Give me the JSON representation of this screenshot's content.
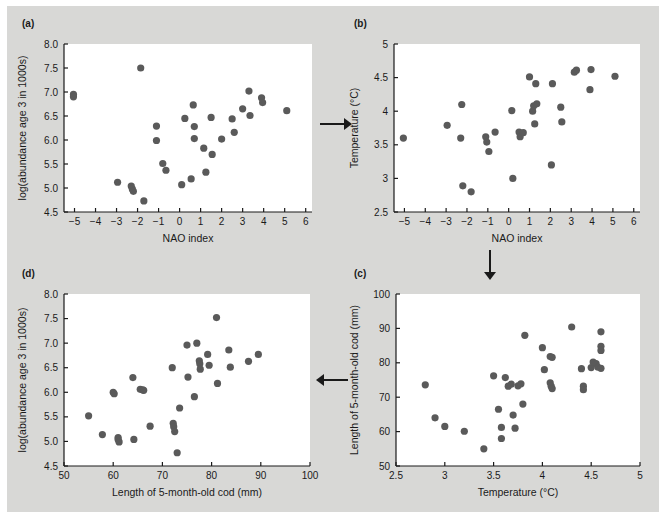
{
  "figure": {
    "background_color": "#d8d8d6",
    "plot_background_color": "#ffffff",
    "marker_color": "#5a5a5a",
    "axis_color": "#1a1a1a"
  },
  "panels": [
    {
      "id": "a",
      "label": "(a)",
      "chart_data": {
        "type": "scatter",
        "title": "",
        "xlabel": "NAO index",
        "ylabel": "log(abundance age 3 in 1000s)",
        "xlim": [
          -5.5,
          6.3
        ],
        "ylim": [
          4.5,
          8.0
        ],
        "xticks": [
          -5,
          -4,
          -3,
          -2,
          -1,
          0,
          1,
          2,
          3,
          4,
          5,
          6
        ],
        "xticklabels": [
          "−5",
          "−4",
          "−3",
          "−2",
          "−1",
          "0",
          "1",
          "2",
          "3",
          "4",
          "5",
          "6"
        ],
        "yticks": [
          4.5,
          5.0,
          5.5,
          6.0,
          6.5,
          7.0,
          7.5,
          8.0
        ],
        "yticklabels": [
          "4.5",
          "5.0",
          "5.5",
          "6.0",
          "6.5",
          "7.0",
          "7.5",
          "8.0"
        ],
        "grid": false,
        "legend": "none",
        "points": [
          [
            -5.05,
            6.95
          ],
          [
            -5.05,
            6.9
          ],
          [
            -2.95,
            5.12
          ],
          [
            -2.3,
            5.04
          ],
          [
            -2.25,
            4.98
          ],
          [
            -2.2,
            4.93
          ],
          [
            -1.85,
            7.5
          ],
          [
            -1.7,
            4.73
          ],
          [
            -1.1,
            6.29
          ],
          [
            -1.1,
            5.99
          ],
          [
            -0.8,
            5.51
          ],
          [
            -0.65,
            5.37
          ],
          [
            0.1,
            5.07
          ],
          [
            0.25,
            6.45
          ],
          [
            0.55,
            5.19
          ],
          [
            0.65,
            6.73
          ],
          [
            0.7,
            6.28
          ],
          [
            0.7,
            6.03
          ],
          [
            1.15,
            5.83
          ],
          [
            1.25,
            5.33
          ],
          [
            1.5,
            6.47
          ],
          [
            1.55,
            5.7
          ],
          [
            2.0,
            6.02
          ],
          [
            2.5,
            6.44
          ],
          [
            2.6,
            6.16
          ],
          [
            3.0,
            6.65
          ],
          [
            3.3,
            7.02
          ],
          [
            3.35,
            6.51
          ],
          [
            3.9,
            6.88
          ],
          [
            3.95,
            6.78
          ],
          [
            5.1,
            6.61
          ]
        ]
      }
    },
    {
      "id": "b",
      "label": "(b)",
      "chart_data": {
        "type": "scatter",
        "title": "",
        "xlabel": "NAO index",
        "ylabel": "Temperature (°C)",
        "xlim": [
          -5.5,
          6.3
        ],
        "ylim": [
          2.5,
          5.0
        ],
        "xticks": [
          -5,
          -4,
          -3,
          -2,
          -1,
          0,
          1,
          2,
          3,
          4,
          5,
          6
        ],
        "xticklabels": [
          "−5",
          "−4",
          "−3",
          "−2",
          "−1",
          "0",
          "1",
          "2",
          "3",
          "4",
          "5",
          "6"
        ],
        "yticks": [
          2.5,
          3,
          3.5,
          4,
          4.5,
          5
        ],
        "yticklabels": [
          "2.5",
          "3",
          "3.5",
          "4",
          "4.5",
          "5"
        ],
        "grid": false,
        "legend": "none",
        "points": [
          [
            -5.05,
            3.6
          ],
          [
            -2.95,
            3.79
          ],
          [
            -2.25,
            4.1
          ],
          [
            -2.3,
            3.6
          ],
          [
            -2.2,
            2.89
          ],
          [
            -1.8,
            2.8
          ],
          [
            -1.1,
            3.62
          ],
          [
            -1.05,
            3.54
          ],
          [
            -0.95,
            3.4
          ],
          [
            -0.65,
            3.69
          ],
          [
            0.15,
            4.01
          ],
          [
            0.2,
            3.0
          ],
          [
            0.5,
            3.69
          ],
          [
            0.55,
            3.62
          ],
          [
            0.7,
            3.68
          ],
          [
            1.0,
            4.51
          ],
          [
            1.15,
            4.0
          ],
          [
            1.2,
            4.08
          ],
          [
            1.3,
            4.41
          ],
          [
            1.35,
            4.11
          ],
          [
            1.25,
            3.81
          ],
          [
            2.05,
            3.2
          ],
          [
            2.1,
            4.41
          ],
          [
            2.5,
            4.06
          ],
          [
            2.55,
            3.84
          ],
          [
            3.15,
            4.58
          ],
          [
            3.25,
            4.61
          ],
          [
            3.95,
            4.62
          ],
          [
            3.9,
            4.32
          ],
          [
            5.1,
            4.52
          ]
        ]
      }
    },
    {
      "id": "c",
      "label": "(c)",
      "chart_data": {
        "type": "scatter",
        "title": "",
        "xlabel": "Temperature (°C)",
        "ylabel": "Length of 5-month-old cod (mm)",
        "xlim": [
          2.5,
          5.0
        ],
        "ylim": [
          50,
          100
        ],
        "xticks": [
          2.5,
          3,
          3.5,
          4,
          4.5,
          5
        ],
        "xticklabels": [
          "2.5",
          "3",
          "3.5",
          "4",
          "4.5",
          "5"
        ],
        "yticks": [
          50,
          60,
          70,
          80,
          90,
          100
        ],
        "yticklabels": [
          "50",
          "60",
          "70",
          "80",
          "90",
          "100"
        ],
        "grid": false,
        "legend": "none",
        "points": [
          [
            2.8,
            73.6
          ],
          [
            2.9,
            64.0
          ],
          [
            3.0,
            61.5
          ],
          [
            3.2,
            60.1
          ],
          [
            3.4,
            55.0
          ],
          [
            3.5,
            76.2
          ],
          [
            3.55,
            66.5
          ],
          [
            3.58,
            61.2
          ],
          [
            3.58,
            58.0
          ],
          [
            3.62,
            75.7
          ],
          [
            3.65,
            73.2
          ],
          [
            3.68,
            73.8
          ],
          [
            3.7,
            64.8
          ],
          [
            3.72,
            61.0
          ],
          [
            3.75,
            73.3
          ],
          [
            3.78,
            73.9
          ],
          [
            3.8,
            68.0
          ],
          [
            3.82,
            88.0
          ],
          [
            4.0,
            84.4
          ],
          [
            4.02,
            78.0
          ],
          [
            4.08,
            81.8
          ],
          [
            4.1,
            81.6
          ],
          [
            4.08,
            74.2
          ],
          [
            4.09,
            73.2
          ],
          [
            4.1,
            72.5
          ],
          [
            4.3,
            90.4
          ],
          [
            4.4,
            78.3
          ],
          [
            4.42,
            73.2
          ],
          [
            4.42,
            72.2
          ],
          [
            4.5,
            78.6
          ],
          [
            4.52,
            80.2
          ],
          [
            4.55,
            79.8
          ],
          [
            4.57,
            78.7
          ],
          [
            4.6,
            89.0
          ],
          [
            4.6,
            84.8
          ],
          [
            4.6,
            83.6
          ],
          [
            4.6,
            78.4
          ]
        ]
      }
    },
    {
      "id": "d",
      "label": "(d)",
      "chart_data": {
        "type": "scatter",
        "title": "",
        "xlabel": "Length of 5-month-old cod (mm)",
        "ylabel": "log(abundance age 3 in 1000s)",
        "xlim": [
          50,
          100
        ],
        "ylim": [
          4.5,
          8.0
        ],
        "xticks": [
          50,
          60,
          70,
          80,
          90,
          100
        ],
        "xticklabels": [
          "50",
          "60",
          "70",
          "80",
          "90",
          "100"
        ],
        "yticks": [
          4.5,
          5.0,
          5.5,
          6.0,
          6.5,
          7.0,
          7.5,
          8.0
        ],
        "yticklabels": [
          "4.5",
          "5.0",
          "5.5",
          "6.0",
          "6.5",
          "7.0",
          "7.5",
          "8.0"
        ],
        "grid": false,
        "legend": "none",
        "points": [
          [
            55.0,
            5.52
          ],
          [
            57.8,
            5.14
          ],
          [
            60.0,
            6.0
          ],
          [
            60.2,
            5.97
          ],
          [
            61.0,
            5.08
          ],
          [
            61.0,
            5.04
          ],
          [
            61.2,
            4.99
          ],
          [
            64.0,
            6.3
          ],
          [
            64.2,
            5.04
          ],
          [
            65.5,
            6.06
          ],
          [
            66.0,
            6.05
          ],
          [
            66.2,
            6.04
          ],
          [
            67.5,
            5.31
          ],
          [
            72.0,
            6.5
          ],
          [
            72.2,
            5.37
          ],
          [
            72.3,
            5.3
          ],
          [
            72.5,
            5.2
          ],
          [
            73.0,
            4.77
          ],
          [
            73.5,
            5.68
          ],
          [
            75.0,
            6.96
          ],
          [
            75.2,
            6.31
          ],
          [
            76.5,
            5.91
          ],
          [
            77.0,
            7.0
          ],
          [
            77.5,
            6.64
          ],
          [
            77.6,
            6.58
          ],
          [
            77.7,
            6.47
          ],
          [
            79.2,
            6.77
          ],
          [
            79.5,
            6.55
          ],
          [
            81.0,
            7.52
          ],
          [
            81.2,
            6.18
          ],
          [
            83.5,
            6.86
          ],
          [
            83.8,
            6.51
          ],
          [
            87.5,
            6.63
          ],
          [
            89.5,
            6.77
          ]
        ]
      }
    }
  ],
  "arrows": [
    {
      "name": "arrow-a-to-b",
      "direction": "right",
      "symbol": "→"
    },
    {
      "name": "arrow-b-to-c",
      "direction": "down",
      "symbol": "↓"
    },
    {
      "name": "arrow-c-to-d",
      "direction": "left",
      "symbol": "←"
    }
  ]
}
